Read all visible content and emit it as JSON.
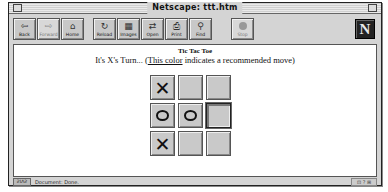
{
  "window": {
    "title": "Netscape: ttt.htm"
  },
  "toolbar": {
    "buttons": [
      {
        "label": "Back",
        "icon": "back-arrow-icon",
        "glyph": "⇦",
        "enabled": true
      },
      {
        "label": "Forward",
        "icon": "forward-arrow-icon",
        "glyph": "⇨",
        "enabled": false
      },
      {
        "label": "Home",
        "icon": "home-icon",
        "glyph": "⌂",
        "enabled": true
      },
      {
        "label": "Reload",
        "icon": "reload-icon",
        "glyph": "↻",
        "enabled": true
      },
      {
        "label": "Images",
        "icon": "images-icon",
        "glyph": "▦",
        "enabled": true
      },
      {
        "label": "Open",
        "icon": "open-icon",
        "glyph": "⇄",
        "enabled": true
      },
      {
        "label": "Print",
        "icon": "print-icon",
        "glyph": "⎙",
        "enabled": true
      },
      {
        "label": "Find",
        "icon": "find-icon",
        "glyph": "⚲",
        "enabled": true
      },
      {
        "label": "Stop",
        "icon": "stop-icon",
        "glyph": "",
        "enabled": false
      }
    ],
    "logo": "N"
  },
  "page": {
    "heading": "Tic Tac Toe",
    "turn_prefix": "It's X's Turn... (",
    "link_text": "This color",
    "turn_suffix": " indicates a recommended move)"
  },
  "board": {
    "cells": [
      "X",
      "",
      "",
      "O",
      "O",
      "",
      "X",
      "",
      ""
    ],
    "recommended_index": 5
  },
  "status": {
    "security_label": "ƧƖɅƧ",
    "text": "Document: Done.",
    "right_label": "⊡ ? ⊞"
  }
}
